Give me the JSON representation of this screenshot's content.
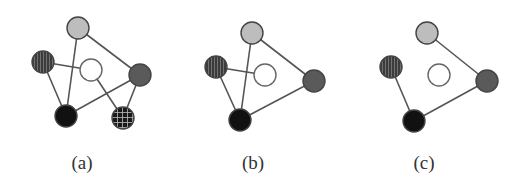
{
  "colors": {
    "edge": "#555555",
    "node_stroke": "#444444",
    "light_gray": "#bdbdbd",
    "white": "#ffffff",
    "dark_gray": "#5a5a5a",
    "black": "#111111",
    "striped_bg": "#3c3c3c",
    "striped_line": "#8a8a8a",
    "grid_bg": "#1a1a1a",
    "grid_line": "#bbbbbb"
  },
  "node_radius": 11,
  "panels": [
    {
      "label": "(a)",
      "label_x": 82,
      "nodes": [
        {
          "id": "top",
          "fill": "light_gray",
          "x": 78,
          "y": 28
        },
        {
          "id": "striped",
          "fill": "striped",
          "x": 43,
          "y": 62
        },
        {
          "id": "center",
          "fill": "white",
          "x": 91,
          "y": 70
        },
        {
          "id": "right",
          "fill": "dark_gray",
          "x": 140,
          "y": 75
        },
        {
          "id": "bottom",
          "fill": "black",
          "x": 66,
          "y": 116
        },
        {
          "id": "grid",
          "fill": "grid",
          "x": 123,
          "y": 118
        }
      ],
      "edges": [
        [
          "top",
          "bottom"
        ],
        [
          "top",
          "right"
        ],
        [
          "striped",
          "center"
        ],
        [
          "striped",
          "bottom"
        ],
        [
          "center",
          "grid"
        ],
        [
          "right",
          "bottom"
        ],
        [
          "right",
          "grid"
        ]
      ]
    },
    {
      "label": "(b)",
      "label_x": 253,
      "nodes": [
        {
          "id": "top",
          "fill": "light_gray",
          "x": 252,
          "y": 33
        },
        {
          "id": "striped",
          "fill": "striped",
          "x": 216,
          "y": 67
        },
        {
          "id": "center",
          "fill": "white",
          "x": 265,
          "y": 75
        },
        {
          "id": "right",
          "fill": "dark_gray",
          "x": 314,
          "y": 81
        },
        {
          "id": "bottom",
          "fill": "black",
          "x": 240,
          "y": 120
        }
      ],
      "edges": [
        [
          "top",
          "bottom"
        ],
        [
          "top",
          "right"
        ],
        [
          "striped",
          "center"
        ],
        [
          "striped",
          "bottom"
        ],
        [
          "right",
          "bottom"
        ]
      ]
    },
    {
      "label": "(c)",
      "label_x": 424,
      "nodes": [
        {
          "id": "top",
          "fill": "light_gray",
          "x": 427,
          "y": 33
        },
        {
          "id": "striped",
          "fill": "striped",
          "x": 391,
          "y": 67
        },
        {
          "id": "center",
          "fill": "white",
          "x": 439,
          "y": 75
        },
        {
          "id": "right",
          "fill": "dark_gray",
          "x": 487,
          "y": 81
        },
        {
          "id": "bottom",
          "fill": "black",
          "x": 414,
          "y": 121
        }
      ],
      "edges": [
        [
          "top",
          "right"
        ],
        [
          "striped",
          "bottom"
        ],
        [
          "right",
          "bottom"
        ]
      ]
    }
  ],
  "label_y": 152
}
